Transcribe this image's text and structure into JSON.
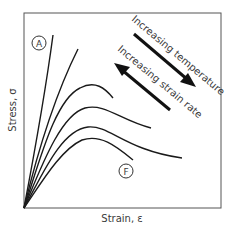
{
  "diagram": {
    "type": "stress-strain curves",
    "x_axis_label": "Strain, ε",
    "y_axis_label": "Stress, σ",
    "markers": {
      "top_curve": "A",
      "bottom_curve": "F"
    },
    "arrows": [
      {
        "label": "Increasing temperature",
        "direction": "down-right"
      },
      {
        "label": "Increasing strain rate",
        "direction": "up-left"
      }
    ],
    "curve_count": 6,
    "colors": {
      "line": "#1a1a1a",
      "frame": "#555555",
      "text": "#3a3a3a"
    }
  }
}
